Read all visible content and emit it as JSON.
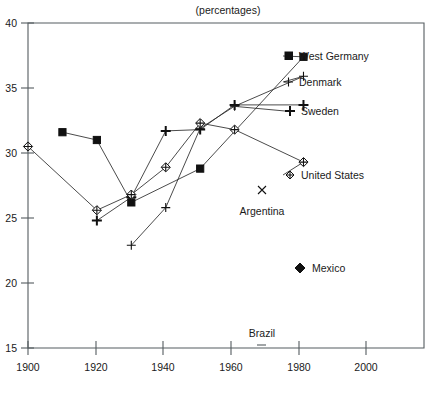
{
  "chart": {
    "title": "(percentages)",
    "type": "scatter"
  },
  "axis": {
    "y_ticks": [
      "40",
      "35",
      "30",
      "25",
      "20",
      "15"
    ],
    "x_ticks": [
      "1900",
      "1920",
      "1940",
      "1960",
      "1980",
      "2000"
    ]
  },
  "labels": {
    "west_germany": "West Germany",
    "denmark": "Denmark",
    "sweden": "Sweden",
    "united_states": "United States",
    "argentina": "Argentina",
    "mexico": "Mexico",
    "brazil": "Brazil"
  },
  "chart_data": {
    "type": "line",
    "title": "(percentages)",
    "subtitle": "",
    "xlabel": "",
    "ylabel": "",
    "xlim": [
      1900,
      2015
    ],
    "ylim": [
      15,
      40
    ],
    "grid": false,
    "legend": "inline-right-labels",
    "x_ticks": [
      1900,
      1920,
      1940,
      1960,
      1980,
      2000
    ],
    "y_ticks": [
      15,
      20,
      25,
      30,
      35,
      40
    ],
    "series": [
      {
        "name": "West Germany",
        "marker": "filled-square",
        "points": [
          {
            "x": 1910,
            "y": 31.6
          },
          {
            "x": 1920,
            "y": 31.0
          },
          {
            "x": 1930,
            "y": 26.2
          },
          {
            "x": 1950,
            "y": 28.8
          },
          {
            "x": 1980,
            "y": 37.4
          }
        ]
      },
      {
        "name": "Denmark",
        "marker": "thin-plus",
        "points": [
          {
            "x": 1930,
            "y": 22.9
          },
          {
            "x": 1940,
            "y": 25.8
          },
          {
            "x": 1950,
            "y": 31.9
          },
          {
            "x": 1960,
            "y": 33.6
          },
          {
            "x": 1980,
            "y": 35.9
          }
        ]
      },
      {
        "name": "Sweden",
        "marker": "bold-plus",
        "points": [
          {
            "x": 1920,
            "y": 24.8
          },
          {
            "x": 1930,
            "y": 26.6
          },
          {
            "x": 1940,
            "y": 31.7
          },
          {
            "x": 1950,
            "y": 31.8
          },
          {
            "x": 1960,
            "y": 33.7
          },
          {
            "x": 1980,
            "y": 33.7
          }
        ]
      },
      {
        "name": "United States",
        "marker": "open-diamond",
        "points": [
          {
            "x": 1900,
            "y": 30.5
          },
          {
            "x": 1920,
            "y": 25.6
          },
          {
            "x": 1930,
            "y": 26.8
          },
          {
            "x": 1940,
            "y": 28.9
          },
          {
            "x": 1950,
            "y": 32.3
          },
          {
            "x": 1960,
            "y": 31.8
          },
          {
            "x": 1980,
            "y": 29.3
          }
        ]
      }
    ],
    "annotations": [
      {
        "label": "Argentina",
        "marker": "x",
        "x": 1969,
        "y": 27.2
      },
      {
        "label": "Mexico",
        "marker": "filled-diamond",
        "x": 1980,
        "y": 21.2
      },
      {
        "label": "Brazil",
        "marker": "dash",
        "x": 1969,
        "y": 15.3
      }
    ]
  }
}
